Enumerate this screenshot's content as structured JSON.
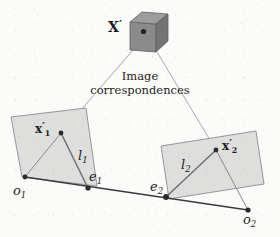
{
  "figure": {
    "title_label": "X'",
    "caption_line_1": "Image",
    "caption_line_2": "correspondences",
    "background_color": "#fbfbfa",
    "plane_fill_color": "#dededd",
    "plane_stroke_color": "#8c8c8c",
    "cube_front_color": "#8b8b8b",
    "cube_top_color": "#9d9d9d",
    "cube_side_color": "#747474",
    "ray_color": "#a8a8a8",
    "baseline_color": "#3a3a3a",
    "point_color": "#2a2a2a",
    "epiline_color": "#8a8a8a",
    "label_color": "#1d1d1d"
  },
  "labels": {
    "world_point": {
      "base": "X",
      "prime": "′",
      "sub": ""
    },
    "image_point_left": {
      "base": "x",
      "prime": "′",
      "sub": "1"
    },
    "image_point_right": {
      "base": "x",
      "prime": "′",
      "sub": "2"
    },
    "epipolar_line_left": {
      "base": "l",
      "prime": "",
      "sub": "1"
    },
    "epipolar_line_right": {
      "base": "l",
      "prime": "",
      "sub": "2"
    },
    "epipole_left": {
      "base": "e",
      "prime": "",
      "sub": "1"
    },
    "epipole_right": {
      "base": "e",
      "prime": "",
      "sub": "2"
    },
    "camera_center_left": {
      "base": "o",
      "prime": "",
      "sub": "1"
    },
    "camera_center_right": {
      "base": "o",
      "prime": "",
      "sub": "2"
    }
  },
  "geometry": {
    "cube": {
      "front_face": "130,22 130,50 156,52 156,24",
      "top_face": "130,22 142,12 168,14 156,24",
      "right_face": "156,24 168,14 168,41 156,52",
      "center_dot": {
        "cx": 143.5,
        "cy": 31.5,
        "r": 2.6
      }
    },
    "left_plane": "11,117 86,108 97,186 22,177",
    "right_plane": "161,146 256,131 264,184 169,199",
    "rays": [
      {
        "x1": 133,
        "y1": 50,
        "x2": 61,
        "y2": 133
      },
      {
        "x1": 157,
        "y1": 52,
        "x2": 216,
        "y2": 150
      }
    ],
    "baseline": {
      "x1": 25,
      "y1": 177,
      "x2": 248,
      "y2": 210
    },
    "epipolar_segments": [
      {
        "x1": 61,
        "y1": 133,
        "x2": 88,
        "y2": 188,
        "name": "l1"
      },
      {
        "x1": 216,
        "y1": 150,
        "x2": 166,
        "y2": 197,
        "name": "l2"
      }
    ],
    "view_segments": [
      {
        "x1": 25,
        "y1": 177,
        "x2": 61,
        "y2": 133
      },
      {
        "x1": 248,
        "y1": 210,
        "x2": 216,
        "y2": 150
      }
    ],
    "points": [
      {
        "name": "x1",
        "cx": 61,
        "cy": 133,
        "r": 2.4
      },
      {
        "name": "x2",
        "cx": 216,
        "cy": 150,
        "r": 2.4
      },
      {
        "name": "e1",
        "cx": 88,
        "cy": 188,
        "r": 2.6
      },
      {
        "name": "e2",
        "cx": 166,
        "cy": 197,
        "r": 2.8
      },
      {
        "name": "o1",
        "cx": 25,
        "cy": 177,
        "r": 2.4
      },
      {
        "name": "o2",
        "cx": 248,
        "cy": 210,
        "r": 2.6
      }
    ]
  }
}
